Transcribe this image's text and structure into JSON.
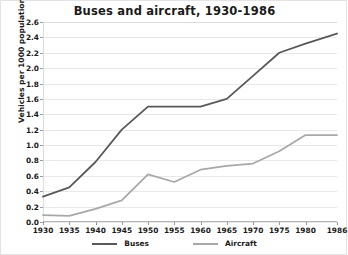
{
  "chart_data": {
    "type": "line",
    "title": "Buses and aircraft, 1930-1986",
    "xlabel": "",
    "ylabel": "Vehicles per 1000 population",
    "categories": [
      "1930",
      "1935",
      "1940",
      "1945",
      "1950",
      "1955",
      "1960",
      "1965",
      "1970",
      "1975",
      "1980",
      "1986"
    ],
    "x": [
      1930,
      1935,
      1940,
      1945,
      1950,
      1955,
      1960,
      1965,
      1970,
      1975,
      1980,
      1986
    ],
    "series": [
      {
        "name": "Buses",
        "color": "#595959",
        "values": [
          0.33,
          0.45,
          0.78,
          1.2,
          1.5,
          1.5,
          1.5,
          1.6,
          1.9,
          2.2,
          2.32,
          2.45
        ]
      },
      {
        "name": "Aircraft",
        "color": "#a8a8a8",
        "values": [
          0.09,
          0.08,
          0.17,
          0.28,
          0.62,
          0.52,
          0.68,
          0.73,
          0.76,
          0.92,
          1.13,
          1.13
        ]
      }
    ],
    "ylim": [
      0.0,
      2.6
    ],
    "ytick_labels": [
      "0.0",
      "0.2",
      "0.4",
      "0.6",
      "0.8",
      "1.0",
      "1.2",
      "1.4",
      "1.6",
      "1.8",
      "2.0",
      "2.2",
      "2.4",
      "2.6"
    ],
    "ytick_values": [
      0.0,
      0.2,
      0.4,
      0.6,
      0.8,
      1.0,
      1.2,
      1.4,
      1.6,
      1.8,
      2.0,
      2.2,
      2.4,
      2.6
    ],
    "grid": true,
    "grid_axis": "y",
    "legend_position": "bottom",
    "legend_entries": [
      "Buses",
      "Aircraft"
    ],
    "background_color": "#ffffff",
    "grid_color": "#e8e8e8",
    "axis_color": "#b4b4b4",
    "text_color": "#1a1a1a"
  }
}
